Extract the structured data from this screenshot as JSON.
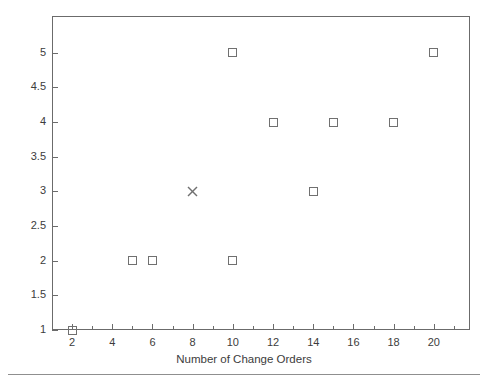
{
  "chart_data": {
    "type": "scatter",
    "title": "",
    "xlabel": "Number of Change Orders",
    "ylabel": "Number of Conflicts",
    "xlim": [
      1.0,
      21.8
    ],
    "ylim": [
      1.0,
      5.53
    ],
    "grid": false,
    "legend": "none",
    "xticks": [
      2,
      4,
      6,
      8,
      10,
      12,
      14,
      16,
      18,
      20
    ],
    "xticklabels": [
      "2",
      "4",
      "6",
      "8",
      "10",
      "12",
      "14",
      "16",
      "18",
      "20"
    ],
    "xminorticks": [
      3,
      5,
      7,
      9,
      11,
      13,
      15,
      17,
      19,
      21
    ],
    "yticks": [
      1,
      1.5,
      2,
      2.5,
      3,
      3.5,
      4,
      4.5,
      5
    ],
    "yticklabels": [
      "1",
      "1.5",
      "2",
      "2.5",
      "3",
      "3.5",
      "4",
      "4.5",
      "5"
    ],
    "series": [
      {
        "name": "observations",
        "marker": "open-square",
        "color": "#707070",
        "points": [
          {
            "x": 2,
            "y": 1
          },
          {
            "x": 5,
            "y": 2
          },
          {
            "x": 6,
            "y": 2
          },
          {
            "x": 10,
            "y": 2
          },
          {
            "x": 10,
            "y": 5
          },
          {
            "x": 12,
            "y": 4
          },
          {
            "x": 14,
            "y": 3
          },
          {
            "x": 15,
            "y": 4
          },
          {
            "x": 18,
            "y": 4
          },
          {
            "x": 20,
            "y": 5
          }
        ]
      },
      {
        "name": "highlighted",
        "marker": "x",
        "color": "#707070",
        "points": [
          {
            "x": 8,
            "y": 3
          }
        ]
      }
    ]
  },
  "figure": {
    "axis_color": "#6b6b6b",
    "text_color": "#3c3c3c",
    "background": "#ffffff",
    "footer_rule_color": "#8f8f8f"
  }
}
